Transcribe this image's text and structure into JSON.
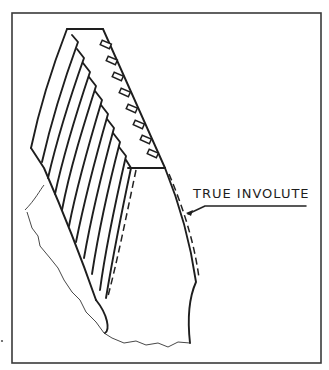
{
  "figure": {
    "labels": {
      "involute": "TRUE INVOLUTE"
    },
    "colors": {
      "ink": "#1e1e1e",
      "background": "#ffffff"
    }
  }
}
